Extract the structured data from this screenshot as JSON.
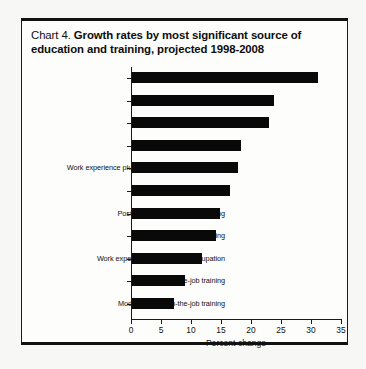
{
  "figure": {
    "title_prefix": "Chart 4. ",
    "title_main": "Growth rates by most significant source of education and training, projected 1998-2008"
  },
  "chart_data": {
    "type": "bar",
    "orientation": "horizontal",
    "title": "Chart 4. Growth rates by most significant source of education and training, projected 1998-2008",
    "xlabel": "Percent change",
    "ylabel": "",
    "xlim": [
      0,
      35
    ],
    "xticks": [
      "0",
      "5",
      "10",
      "15",
      "20",
      "25",
      "30",
      "35"
    ],
    "grid": false,
    "legend": null,
    "bar_color": "#090909",
    "categories": [
      "Associate degree",
      "Bachelor's degree",
      "Doctoral degree",
      "Master's degree",
      "Work experience plus bachelor's degree or higher",
      "First professional degree",
      "Postsecondary vocational training",
      "Short-term on-the-job training",
      "Work experience in a related occupation",
      "Long-term on-the-job training",
      "Moderate-term on-the-job training"
    ],
    "values": [
      31,
      23.7,
      22.8,
      18.2,
      17.7,
      16.3,
      14.7,
      14,
      11.7,
      8.9,
      7
    ]
  }
}
